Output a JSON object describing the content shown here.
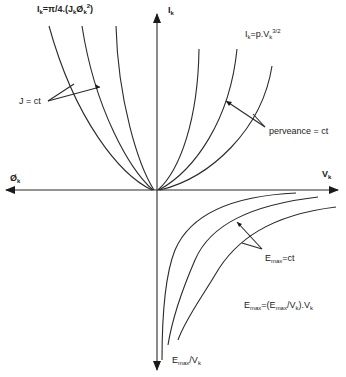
{
  "diagram": {
    "type": "electron-gun characteristic curves",
    "axes": {
      "vertical_up": {
        "label": "I",
        "sub": "k"
      },
      "horizontal_right": {
        "label": "V",
        "sub": "k"
      },
      "horizontal_left": {
        "label": "Ø",
        "sub": "k"
      },
      "vertical_down": {
        "label": "E",
        "sub": "max",
        "suffix": "/V",
        "suffix_sub": "k"
      }
    },
    "equations": {
      "current_density": {
        "lhs": "I",
        "lhs_sub": "k",
        "rhs": "=π/4.(J",
        "rhs_sub1": "k",
        "mid": "Ø",
        "rhs_sub2": "k",
        "sup": "2",
        "end": ")"
      },
      "perveance": {
        "lhs": "I",
        "lhs_sub": "k",
        "rhs": "=p.V",
        "rhs_sub": "k",
        "sup": "3/2"
      },
      "field": {
        "lhs": "E",
        "lhs_sub": "max",
        "mid": "=(E",
        "mid_sub": "max",
        "mid2": "/V",
        "mid2_sub": "k",
        "end": ").V",
        "end_sub": "k"
      }
    },
    "annotations": {
      "j_const": "J = ct",
      "perveance_const": "perveance = ct",
      "emax_const": {
        "main": "E",
        "sub": "max",
        "rest": "=ct"
      }
    },
    "curve_families": [
      {
        "name": "J = ct",
        "quadrant": "upper-left",
        "count": 3
      },
      {
        "name": "perveance = ct",
        "quadrant": "upper-right",
        "count": 3
      },
      {
        "name": "Emax = ct",
        "quadrant": "lower-right",
        "count": 3
      }
    ],
    "colors": {
      "line": "#2a2a2a",
      "background": "#ffffff"
    }
  }
}
